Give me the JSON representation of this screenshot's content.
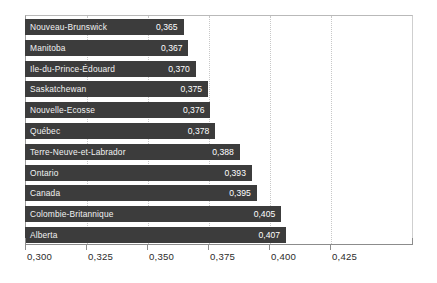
{
  "chart_data": {
    "type": "bar",
    "orientation": "horizontal",
    "title": "",
    "subtitle": "",
    "xlabel": "",
    "ylabel": "",
    "xlim": [
      0.3,
      0.459
    ],
    "xticks": [
      0.3,
      0.325,
      0.35,
      0.375,
      0.4,
      0.425
    ],
    "xtick_labels": [
      "0,300",
      "0,325",
      "0,350",
      "0,375",
      "0,400",
      "0,425"
    ],
    "grid": "vertical-dotted",
    "legend": "none",
    "decimal_separator": ",",
    "bar_color": "#3c3c3c",
    "label_color": "#f2f2f2",
    "categories": [
      "Nouveau-Brunswick",
      "Manitoba",
      "Ile-du-Prince-Édouard",
      "Saskatchewan",
      "Nouvelle-Ecosse",
      "Québec",
      "Terre-Neuve-et-Labrador",
      "Ontario",
      "Canada",
      "Colombie-Britannique",
      "Alberta"
    ],
    "values": [
      0.365,
      0.367,
      0.37,
      0.375,
      0.376,
      0.378,
      0.388,
      0.393,
      0.395,
      0.405,
      0.407
    ],
    "value_labels": [
      "0,365",
      "0,367",
      "0,370",
      "0,375",
      "0,376",
      "0,378",
      "0,388",
      "0,393",
      "0,395",
      "0,405",
      "0,407"
    ]
  }
}
